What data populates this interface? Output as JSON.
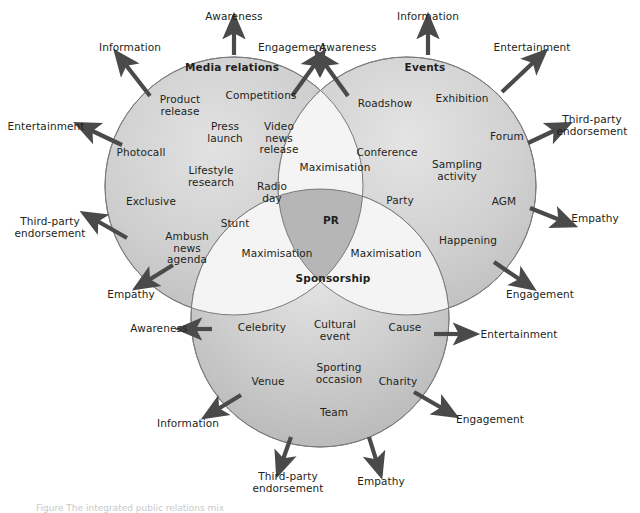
{
  "figure": {
    "type": "venn-diagram",
    "set_count": 3,
    "caption_partial": "Figure  The integrated public relations mix"
  },
  "colors": {
    "circle_fill": "#c9c9c9",
    "circle_fill_light": "#d6d6d6",
    "lens_fill": "#f2f2f2",
    "triple_fill": "#b0b0b0",
    "stroke": "#7a7a7a",
    "arrow": "#4a4a4a",
    "text": "#231f20",
    "background": "#ffffff"
  },
  "circles": [
    {
      "id": "media-relations",
      "title": "Media relations",
      "title_pos": {
        "x": 232,
        "y": 68
      },
      "center": {
        "x": 234,
        "y": 186
      },
      "radius": 129,
      "items": [
        {
          "label": "Product release",
          "x": 180,
          "y": 105,
          "lines": [
            "Product",
            "release"
          ]
        },
        {
          "label": "Competitions",
          "x": 261,
          "y": 96,
          "lines": [
            "Competitions"
          ]
        },
        {
          "label": "Press launch",
          "x": 225,
          "y": 132,
          "lines": [
            "Press",
            "launch"
          ]
        },
        {
          "label": "Video news release",
          "x": 279,
          "y": 138,
          "lines": [
            "Video",
            "news",
            "release"
          ]
        },
        {
          "label": "Photocall",
          "x": 141,
          "y": 153,
          "lines": [
            "Photocall"
          ]
        },
        {
          "label": "Lifestyle research",
          "x": 211,
          "y": 176,
          "lines": [
            "Lifestyle",
            "research"
          ]
        },
        {
          "label": "Radio day",
          "x": 272,
          "y": 192,
          "lines": [
            "Radio",
            "day"
          ]
        },
        {
          "label": "Exclusive",
          "x": 151,
          "y": 202,
          "lines": [
            "Exclusive"
          ]
        },
        {
          "label": "Stunt",
          "x": 235,
          "y": 224,
          "lines": [
            "Stunt"
          ]
        },
        {
          "label": "Ambush news agenda",
          "x": 187,
          "y": 248,
          "lines": [
            "Ambush",
            "news",
            "agenda"
          ]
        }
      ],
      "arrows": [
        {
          "label": "Awareness",
          "label_x": 234,
          "label_y": 17,
          "tail_x": 234,
          "tail_y": 55,
          "head_x": 234,
          "head_y": 26,
          "multiline": false
        },
        {
          "label": "Information",
          "label_x": 130,
          "label_y": 48,
          "tail_x": 150,
          "tail_y": 96,
          "head_x": 122,
          "head_y": 60,
          "multiline": false
        },
        {
          "label": "Engagement",
          "label_x": 292,
          "label_y": 48,
          "tail_x": 292,
          "tail_y": 96,
          "head_x": 318,
          "head_y": 60,
          "multiline": false
        },
        {
          "label": "Entertainment",
          "label_x": 46,
          "label_y": 127,
          "tail_x": 122,
          "tail_y": 145,
          "head_x": 86,
          "head_y": 128,
          "multiline": false
        },
        {
          "label": "Third-party endorsement",
          "label_x": 50,
          "label_y": 227,
          "tail_x": 127,
          "tail_y": 238,
          "head_x": 92,
          "head_y": 218,
          "multiline": true,
          "lines": [
            "Third-party",
            "endorsement"
          ]
        },
        {
          "label": "Empathy",
          "label_x": 131,
          "label_y": 295,
          "tail_x": 173,
          "tail_y": 265,
          "head_x": 144,
          "head_y": 283,
          "multiline": false
        }
      ]
    },
    {
      "id": "events",
      "title": "Events",
      "title_pos": {
        "x": 425,
        "y": 68
      },
      "center": {
        "x": 407,
        "y": 186
      },
      "radius": 129,
      "items": [
        {
          "label": "Roadshow",
          "x": 385,
          "y": 104,
          "lines": [
            "Roadshow"
          ]
        },
        {
          "label": "Exhibition",
          "x": 462,
          "y": 99,
          "lines": [
            "Exhibition"
          ]
        },
        {
          "label": "Forum",
          "x": 507,
          "y": 137,
          "lines": [
            "Forum"
          ]
        },
        {
          "label": "Conference",
          "x": 387,
          "y": 153,
          "lines": [
            "Conference"
          ]
        },
        {
          "label": "Sampling activity",
          "x": 457,
          "y": 170,
          "lines": [
            "Sampling",
            "activity"
          ]
        },
        {
          "label": "Party",
          "x": 400,
          "y": 201,
          "lines": [
            "Party"
          ]
        },
        {
          "label": "AGM",
          "x": 504,
          "y": 202,
          "lines": [
            "AGM"
          ]
        },
        {
          "label": "Happening",
          "x": 468,
          "y": 241,
          "lines": [
            "Happening"
          ]
        }
      ],
      "arrows": [
        {
          "label": "Information",
          "label_x": 428,
          "label_y": 17,
          "tail_x": 428,
          "tail_y": 55,
          "head_x": 428,
          "head_y": 26,
          "multiline": false
        },
        {
          "label": "Awareness",
          "label_x": 348,
          "label_y": 48,
          "tail_x": 348,
          "tail_y": 96,
          "head_x": 322,
          "head_y": 60,
          "multiline": false
        },
        {
          "label": "Entertainment",
          "label_x": 532,
          "label_y": 48,
          "tail_x": 502,
          "tail_y": 92,
          "head_x": 538,
          "head_y": 58,
          "multiline": false
        },
        {
          "label": "Third-party endorsement",
          "label_x": 592,
          "label_y": 125,
          "tail_x": 528,
          "tail_y": 143,
          "head_x": 560,
          "head_y": 128,
          "multiline": true,
          "lines": [
            "Third-party",
            "endorsement"
          ]
        },
        {
          "label": "Empathy",
          "label_x": 595,
          "label_y": 219,
          "tail_x": 530,
          "tail_y": 208,
          "head_x": 565,
          "head_y": 222,
          "multiline": false
        },
        {
          "label": "Engagement",
          "label_x": 540,
          "label_y": 295,
          "tail_x": 494,
          "tail_y": 262,
          "head_x": 525,
          "head_y": 283,
          "multiline": false
        }
      ]
    },
    {
      "id": "sponsorship",
      "title": "Sponsorship",
      "title_pos": {
        "x": 333,
        "y": 279
      },
      "center": {
        "x": 320,
        "y": 318
      },
      "radius": 129,
      "items": [
        {
          "label": "Celebrity",
          "x": 262,
          "y": 328,
          "lines": [
            "Celebrity"
          ]
        },
        {
          "label": "Cultural event",
          "x": 335,
          "y": 330,
          "lines": [
            "Cultural",
            "event"
          ]
        },
        {
          "label": "Cause",
          "x": 405,
          "y": 328,
          "lines": [
            "Cause"
          ]
        },
        {
          "label": "Sporting occasion",
          "x": 339,
          "y": 373,
          "lines": [
            "Sporting",
            "occasion"
          ]
        },
        {
          "label": "Venue",
          "x": 268,
          "y": 382,
          "lines": [
            "Venue"
          ]
        },
        {
          "label": "Charity",
          "x": 398,
          "y": 382,
          "lines": [
            "Charity"
          ]
        },
        {
          "label": "Team",
          "x": 334,
          "y": 413,
          "lines": [
            "Team"
          ]
        }
      ],
      "arrows": [
        {
          "label": "Awareness",
          "label_x": 159,
          "label_y": 329,
          "tail_x": 212,
          "tail_y": 329,
          "head_x": 189,
          "head_y": 329,
          "multiline": false
        },
        {
          "label": "Entertainment",
          "label_x": 519,
          "label_y": 335,
          "tail_x": 434,
          "tail_y": 334,
          "head_x": 466,
          "head_y": 334,
          "multiline": false
        },
        {
          "label": "Information",
          "label_x": 188,
          "label_y": 424,
          "tail_x": 241,
          "tail_y": 395,
          "head_x": 213,
          "head_y": 412,
          "multiline": false
        },
        {
          "label": "Engagement",
          "label_x": 490,
          "label_y": 420,
          "tail_x": 414,
          "tail_y": 392,
          "head_x": 447,
          "head_y": 411,
          "multiline": false
        },
        {
          "label": "Third-party endorsement",
          "label_x": 288,
          "label_y": 482,
          "tail_x": 291,
          "tail_y": 437,
          "head_x": 281,
          "head_y": 465,
          "multiline": true,
          "lines": [
            "Third-party",
            "endorsement"
          ]
        },
        {
          "label": "Empathy",
          "label_x": 381,
          "label_y": 482,
          "tail_x": 369,
          "tail_y": 437,
          "head_x": 378,
          "head_y": 466,
          "multiline": false
        }
      ]
    }
  ],
  "intersections": [
    {
      "id": "media-events",
      "label": "Maximisation",
      "x": 335,
      "y": 168,
      "type": "pair"
    },
    {
      "id": "media-sponsorship",
      "label": "Maximisation",
      "x": 277,
      "y": 254,
      "type": "pair"
    },
    {
      "id": "events-sponsorship",
      "label": "Maximisation",
      "x": 386,
      "y": 254,
      "type": "pair"
    },
    {
      "id": "all-three",
      "label": "PR",
      "x": 331,
      "y": 221,
      "type": "triple"
    }
  ]
}
